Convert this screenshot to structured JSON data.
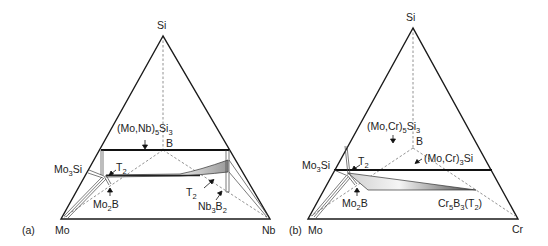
{
  "figure": {
    "panels": [
      {
        "id": "a",
        "panel_label": "(a)",
        "corners": {
          "top": "Si",
          "left": "Mo",
          "right": "Nb"
        },
        "center_point": "B",
        "phases": {
          "m5si3": {
            "base": "(Mo,Nb)",
            "s1": "5",
            "mid": "Si",
            "s2": "3"
          },
          "mo3si": {
            "base": "Mo",
            "s1": "3",
            "mid": "Si"
          },
          "t2_left": {
            "base": "T",
            "s1": "2"
          },
          "mo2b": {
            "base": "Mo",
            "s1": "2",
            "mid": "B"
          },
          "t2_right": {
            "base": "T",
            "s1": "2"
          },
          "nb3b2": {
            "base": "Nb",
            "s1": "3",
            "mid": "B",
            "s2": "2"
          }
        }
      },
      {
        "id": "b",
        "panel_label": "(b)",
        "corners": {
          "top": "Si",
          "left": "Mo",
          "right": "Cr"
        },
        "center_point": "B",
        "phases": {
          "m5si3": {
            "base": "(Mo,Cr)",
            "s1": "5",
            "mid": "Si",
            "s2": "3"
          },
          "m3si": {
            "base": "(Mo,Cr)",
            "s1": "3",
            "mid": "Si"
          },
          "mo3si": {
            "base": "Mo",
            "s1": "3",
            "mid": "Si"
          },
          "t2": {
            "base": "T",
            "s1": "2"
          },
          "mo2b": {
            "base": "Mo",
            "s1": "2",
            "mid": "B"
          },
          "cr5b3": {
            "base": "Cr",
            "s1": "5",
            "mid": "B",
            "s2": "3",
            "tail": "(T",
            "s3": "2",
            "end": ")"
          }
        }
      }
    ],
    "colors": {
      "line": "#1a1a1a",
      "dashed": "#777777",
      "shade_light": "#f4f4f4",
      "shade_dark": "#8a8a8a"
    }
  }
}
